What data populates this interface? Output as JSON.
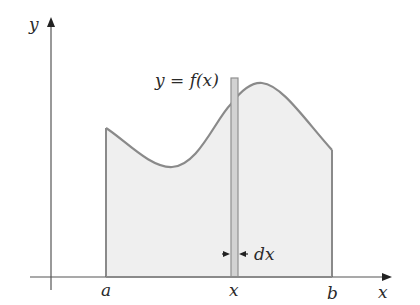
{
  "figure": {
    "labels": {
      "y_axis": "y",
      "x_axis": "x",
      "a": "a",
      "b": "b",
      "x_point": "x",
      "dx": "dx",
      "function_label": "y = f(x)"
    },
    "colors": {
      "axis": "#555555",
      "curve": "#8a8a8a",
      "fill": "#efefef",
      "strip_fill": "#d2d2d2",
      "strip_stroke": "#8f8f8f",
      "arrow": "#222222",
      "text": "#2a2a2a"
    }
  }
}
